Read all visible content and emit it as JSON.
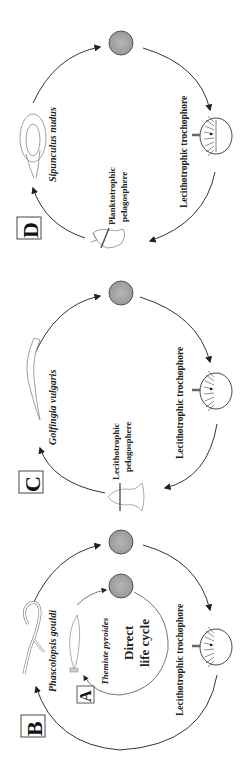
{
  "figure": {
    "orientation": "rotated 90deg clockwise",
    "panels": [
      {
        "id": "D",
        "letter": "D",
        "species": "Sipunculus nudus",
        "stage1": "Lecithotrophic trochophore",
        "stage2_line1": "Planktotrophic",
        "stage2_line2": "pelagosphere"
      },
      {
        "id": "C",
        "letter": "C",
        "species": "Golfingia vulgaris",
        "stage1": "Lecithotrophic trochophore",
        "stage2_line1": "Lecithotrophic",
        "stage2_line2": "pelagosphere"
      },
      {
        "id": "B",
        "letter": "B",
        "species": "Phascolopsis gouldi",
        "stage1": "Lecithotrophic trochophore"
      },
      {
        "id": "A",
        "letter": "A",
        "species": "Themiste pyroides",
        "center_line1": "Direct",
        "center_line2": "life cycle"
      }
    ]
  },
  "colors": {
    "egg_fill": "#a8a8a8",
    "egg_stroke": "#555555",
    "arrow": "#222222",
    "outline": "#777777"
  }
}
